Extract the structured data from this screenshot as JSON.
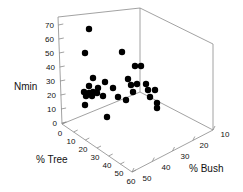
{
  "chart_data": {
    "type": "scatter",
    "title": "",
    "projection": "3d",
    "xlabel": "% Tree",
    "ylabel": "Nmin",
    "zlabel": "% Bush",
    "axes": {
      "nmin": {
        "label": "Nmin",
        "ticks": [
          0,
          10,
          20,
          30,
          40,
          50,
          60,
          70
        ],
        "ticklabels": [
          "0",
          "10",
          "20",
          "30",
          "40",
          "50",
          "60",
          "70"
        ],
        "range": [
          0,
          70
        ]
      },
      "tree": {
        "label": "% Tree",
        "ticks": [
          0,
          10,
          20,
          30,
          40,
          50,
          60
        ],
        "ticklabels": [
          "0",
          "10",
          "20",
          "30",
          "40",
          "50",
          "60"
        ],
        "range": [
          0,
          60
        ]
      },
      "bush": {
        "label": "% Bush",
        "ticks": [
          50,
          40,
          30,
          20,
          10
        ],
        "ticklabels": [
          "50",
          "40",
          "30",
          "20",
          "10"
        ],
        "range": [
          50,
          10
        ]
      }
    },
    "grid": false,
    "legend": null,
    "marker": {
      "shape": "circle",
      "color": "#000000",
      "size": 3.2
    },
    "points_px": [
      [
        89,
        29
      ],
      [
        85,
        53
      ],
      [
        122,
        52
      ],
      [
        135,
        66
      ],
      [
        141,
        66
      ],
      [
        93,
        78
      ],
      [
        105,
        82
      ],
      [
        128,
        79
      ],
      [
        131,
        85
      ],
      [
        137,
        84
      ],
      [
        146,
        84
      ],
      [
        89,
        86
      ],
      [
        98,
        88
      ],
      [
        113,
        88
      ],
      [
        84,
        92
      ],
      [
        89,
        93
      ],
      [
        93,
        92
      ],
      [
        97,
        93
      ],
      [
        86,
        96
      ],
      [
        92,
        96
      ],
      [
        103,
        96
      ],
      [
        118,
        97
      ],
      [
        133,
        92
      ],
      [
        148,
        90
      ],
      [
        155,
        90
      ],
      [
        126,
        100
      ],
      [
        150,
        97
      ],
      [
        85,
        105
      ],
      [
        157,
        103
      ],
      [
        157,
        108
      ],
      [
        107,
        117
      ]
    ],
    "n_points": 31
  },
  "geometry": {
    "origin": [
      62,
      124
    ],
    "back_top": [
      58,
      17
    ],
    "back_corner_top": [
      140,
      8
    ],
    "back_corner_bottom": [
      140,
      92
    ],
    "right_corner": [
      213,
      130
    ],
    "right_top": [
      213,
      44
    ],
    "front_corner": [
      132,
      172
    ]
  }
}
